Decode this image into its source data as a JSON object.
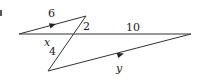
{
  "figure": {
    "type": "geometry-diagram",
    "stroke_color": "#333333",
    "labels": {
      "top_segment": "6",
      "transversal_upper": "2",
      "horizontal_right": "10",
      "horizontal_left": "x",
      "transversal_lower": "4",
      "bottom_segment": "y"
    },
    "points": {
      "left_vertex": [
        19,
        34
      ],
      "top_vertex": [
        86,
        16
      ],
      "crossing": [
        74,
        34
      ],
      "bottom_vertex": [
        48,
        71
      ],
      "right_vertex": [
        191,
        34
      ]
    },
    "parallel_marks": [
      "top_segment",
      "bottom_segment"
    ]
  }
}
